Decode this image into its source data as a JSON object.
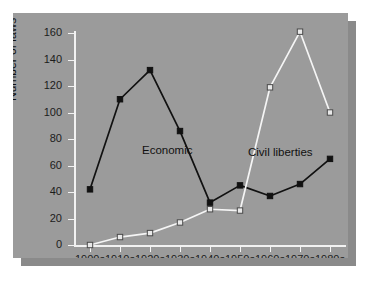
{
  "chart_data": {
    "type": "line",
    "title": "",
    "xlabel": "",
    "ylabel": "Number of laws",
    "categories": [
      "1900s",
      "1910s",
      "1920s",
      "1930s",
      "1940s",
      "1950s",
      "1960s",
      "1970s",
      "1980s"
    ],
    "ylim": [
      0,
      160
    ],
    "yticks": [
      0,
      20,
      40,
      60,
      80,
      100,
      120,
      140,
      160
    ],
    "ytick_labels": [
      "0",
      "20",
      "40",
      "60",
      "80",
      "100",
      "120",
      "140",
      "160"
    ],
    "grid": false,
    "legend": "inline-annotations",
    "series": [
      {
        "name": "Economic",
        "color": "#111111",
        "marker": "filled-square",
        "values": [
          42,
          110,
          132,
          86,
          32,
          45,
          37,
          46,
          65
        ]
      },
      {
        "name": "Civil liberties",
        "color": "#f5f5f5",
        "marker": "open-square",
        "values": [
          0,
          6,
          9,
          17,
          27,
          26,
          119,
          161,
          100
        ]
      }
    ],
    "annotations": [
      {
        "text": "Economic",
        "series": "Economic"
      },
      {
        "text": "Civil liberties",
        "series": "Civil liberties"
      }
    ]
  },
  "colors": {
    "panel_background": "#9b9b9b",
    "page_background": "#ffffff",
    "shadow": "#8a8a8a",
    "axis": "#f2f2f2",
    "economic_line": "#111111",
    "civil_liberties_line": "#f5f5f5",
    "text": "#111111"
  }
}
